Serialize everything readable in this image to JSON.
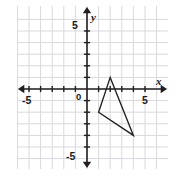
{
  "chart_data": {
    "type": "scatter",
    "title": "",
    "xlabel": "x",
    "ylabel": "y",
    "xlim": [
      -6,
      6
    ],
    "ylim": [
      -6,
      6
    ],
    "grid": true,
    "legend": null,
    "origin_label": "0",
    "x_tick_labels": [
      {
        "value": -5,
        "text": "-5"
      },
      {
        "value": 5,
        "text": "5"
      }
    ],
    "y_tick_labels": [
      {
        "value": 5,
        "text": "5"
      },
      {
        "value": -5,
        "text": "-5"
      }
    ],
    "x_ticks_all": [
      -5,
      -4,
      -3,
      -2,
      -1,
      1,
      2,
      3,
      4,
      5
    ],
    "y_ticks_all": [
      -5,
      -4,
      -3,
      -2,
      -1,
      1,
      2,
      3,
      4,
      5
    ],
    "annotations": [
      {
        "name": "triangle",
        "type": "polygon",
        "closed": true,
        "stroke": "#231f20",
        "fill": "none",
        "vertices": [
          {
            "x": 2,
            "y": 1
          },
          {
            "x": 1,
            "y": -2
          },
          {
            "x": 4,
            "y": -4
          }
        ]
      }
    ]
  },
  "style": {
    "grid_color": "#d9d9dd",
    "axis_color": "#231f20",
    "shape_color": "#231f20",
    "background": "#ffffff"
  },
  "icons": {
    "x_axis_arrow": "arrow-right-icon",
    "y_axis_arrow": "arrow-up-icon"
  }
}
